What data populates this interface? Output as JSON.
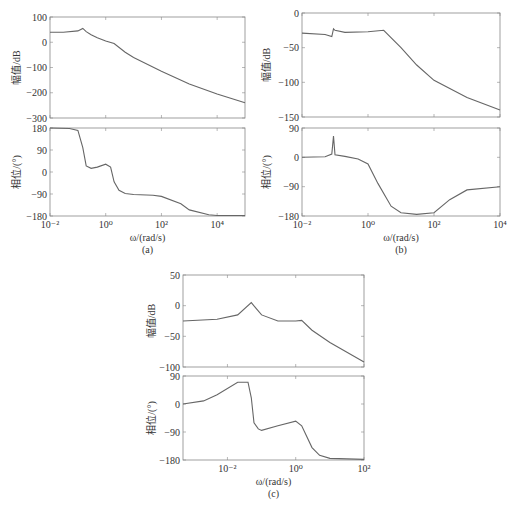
{
  "chart_data": [
    {
      "id": "a",
      "type": "line",
      "caption": "(a)",
      "xlabel": "ω/(rad/s)",
      "x_scale": "log",
      "x_ticks": [
        "10⁻²",
        "10⁰",
        "10²",
        "10⁴"
      ],
      "xlim": [
        0.01,
        100000
      ],
      "subplots": [
        {
          "name": "magnitude",
          "ylabel": "幅值/dB",
          "ylim": [
            -300,
            100
          ],
          "y_ticks": [
            "100",
            "0",
            "-100",
            "-200",
            "-300"
          ],
          "x": [
            0.01,
            0.03,
            0.1,
            0.15,
            0.2,
            0.3,
            0.5,
            1,
            2,
            5,
            10,
            100,
            1000,
            10000,
            100000
          ],
          "values": [
            40,
            40,
            45,
            55,
            42,
            30,
            18,
            5,
            -5,
            -40,
            -60,
            -115,
            -165,
            -205,
            -240
          ]
        },
        {
          "name": "phase",
          "ylabel": "相位/(°)",
          "ylim": [
            -180,
            180
          ],
          "y_ticks": [
            "180",
            "90",
            "0",
            "-90",
            "-180"
          ],
          "x": [
            0.01,
            0.05,
            0.1,
            0.15,
            0.2,
            0.3,
            0.5,
            1,
            1.5,
            2,
            3,
            5,
            10,
            50,
            100,
            500,
            1000,
            5000,
            10000,
            100000
          ],
          "values": [
            180,
            178,
            170,
            100,
            25,
            15,
            20,
            32,
            20,
            -40,
            -75,
            -88,
            -92,
            -95,
            -100,
            -130,
            -155,
            -175,
            -178,
            -178
          ]
        }
      ]
    },
    {
      "id": "b",
      "type": "line",
      "caption": "(b)",
      "xlabel": "ω/(rad/s)",
      "x_scale": "log",
      "x_ticks": [
        "10⁻²",
        "10⁰",
        "10²",
        "10⁴"
      ],
      "xlim": [
        0.01,
        10000
      ],
      "subplots": [
        {
          "name": "magnitude",
          "ylabel": "幅值/dB",
          "ylim": [
            -150,
            0
          ],
          "y_ticks": [
            "0",
            "-50",
            "-100",
            "-150"
          ],
          "x": [
            0.01,
            0.05,
            0.08,
            0.09,
            0.1,
            0.2,
            1,
            3,
            10,
            30,
            100,
            1000,
            10000
          ],
          "values": [
            -29,
            -31,
            -34,
            -23,
            -25,
            -28,
            -27,
            -25,
            -50,
            -75,
            -97,
            -122,
            -140
          ]
        },
        {
          "name": "phase",
          "ylabel": "相位/(°)",
          "ylim": [
            -180,
            90
          ],
          "y_ticks": [
            "90",
            "0",
            "-90",
            "-180"
          ],
          "x": [
            0.01,
            0.05,
            0.08,
            0.09,
            0.1,
            0.2,
            0.5,
            1,
            2,
            5,
            10,
            30,
            100,
            300,
            1000,
            10000
          ],
          "values": [
            0,
            2,
            10,
            65,
            8,
            3,
            -5,
            -20,
            -80,
            -150,
            -170,
            -175,
            -170,
            -130,
            -100,
            -90
          ]
        }
      ]
    },
    {
      "id": "c",
      "type": "line",
      "caption": "(c)",
      "xlabel": "ω/(rad/s)",
      "x_scale": "log",
      "x_ticks": [
        "10⁻²",
        "10⁰",
        "10²"
      ],
      "xlim": [
        0.0005,
        100
      ],
      "subplots": [
        {
          "name": "magnitude",
          "ylabel": "幅值/dB",
          "ylim": [
            -100,
            50
          ],
          "y_ticks": [
            "50",
            "0",
            "-50",
            "-100"
          ],
          "x": [
            0.0005,
            0.005,
            0.02,
            0.05,
            0.07,
            0.1,
            0.3,
            0.5,
            1,
            1.5,
            3,
            10,
            100
          ],
          "values": [
            -25,
            -22,
            -15,
            5,
            -5,
            -15,
            -25,
            -25,
            -25,
            -24,
            -40,
            -60,
            -92
          ]
        },
        {
          "name": "phase",
          "ylabel": "相位/(°)",
          "ylim": [
            -180,
            90
          ],
          "y_ticks": [
            "90",
            "0",
            "-90",
            "-180"
          ],
          "x": [
            0.0005,
            0.002,
            0.005,
            0.02,
            0.04,
            0.05,
            0.06,
            0.08,
            0.1,
            0.3,
            1,
            1.5,
            3,
            5,
            10,
            100
          ],
          "values": [
            0,
            10,
            30,
            70,
            70,
            20,
            -60,
            -80,
            -85,
            -70,
            -55,
            -70,
            -140,
            -165,
            -175,
            -178
          ]
        }
      ]
    }
  ]
}
